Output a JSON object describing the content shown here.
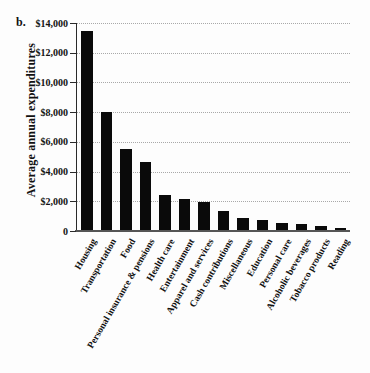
{
  "figure": {
    "label": "b."
  },
  "chart_data": {
    "type": "bar",
    "title": "",
    "xlabel": "",
    "ylabel": "Average annual expenditures",
    "ylim": [
      0,
      14000
    ],
    "ytick_interval": 2000,
    "grid": "horizontal-dotted",
    "legend": "none",
    "bar_color": "#0a0a0a",
    "gridline_color": "#a9a9a9",
    "axis_color": "#2a2a2a",
    "yticks": [
      {
        "value": 0,
        "label": "0"
      },
      {
        "value": 2000,
        "label": "$2,000"
      },
      {
        "value": 4000,
        "label": "$4,000"
      },
      {
        "value": 6000,
        "label": "$6,000"
      },
      {
        "value": 8000,
        "label": "$8,000"
      },
      {
        "value": 10000,
        "label": "$10,000"
      },
      {
        "value": 12000,
        "label": "$12,000"
      },
      {
        "value": 14000,
        "label": "$14,000"
      }
    ],
    "categories": [
      "Housing",
      "Transportation",
      "Food",
      "Personal insurance & pensions",
      "Health care",
      "Entertainment",
      "Apparel and services",
      "Cash contributions",
      "Miscellaneous",
      "Education",
      "Personal care",
      "Alcoholic beverages",
      "Tobacco products",
      "Reading"
    ],
    "values": [
      13400,
      7950,
      5450,
      4550,
      2350,
      2100,
      1900,
      1250,
      800,
      700,
      500,
      400,
      300,
      130
    ]
  }
}
